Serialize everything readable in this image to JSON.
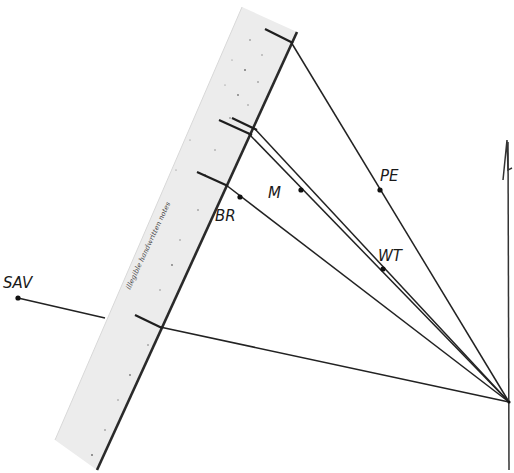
{
  "diagram": {
    "type": "resection-plot",
    "convergence_point": {
      "x": 509,
      "y": 402
    },
    "north_arrow": {
      "label": "",
      "direction": "north"
    },
    "ruler": {
      "description": "straightedge with handwritten scale notes",
      "handwriting": "illegible handwritten notes"
    },
    "points": [
      {
        "id": "PE",
        "label": "PE",
        "x": 380,
        "y": 190,
        "label_x": 382,
        "label_y": 180
      },
      {
        "id": "WT",
        "label": "WT",
        "x": 383,
        "y": 269,
        "label_x": 380,
        "label_y": 260
      },
      {
        "id": "M",
        "label": "M",
        "x": 301,
        "y": 190,
        "label_x": 268,
        "label_y": 197
      },
      {
        "id": "BR",
        "label": "BR",
        "x": 240,
        "y": 197,
        "label_x": 216,
        "label_y": 220
      },
      {
        "id": "SAV",
        "label": "SAV",
        "x": 18,
        "y": 298,
        "label_x": 4,
        "label_y": 283
      }
    ]
  },
  "colors": {
    "ink": "#1e1e1e",
    "ruler_fill": "#ebebeb",
    "ruler_edge": "#333333",
    "background": "#ffffff"
  }
}
